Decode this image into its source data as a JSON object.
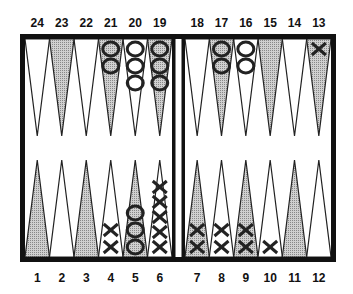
{
  "game": "backgammon",
  "colors": {
    "frame": "#111111",
    "dark_point": "#b8b8b8",
    "light_point": "#ffffff",
    "checker_stroke": "#222222"
  },
  "top_labels": [
    "24",
    "23",
    "22",
    "21",
    "20",
    "19",
    "18",
    "17",
    "16",
    "15",
    "14",
    "13"
  ],
  "bottom_labels": [
    "1",
    "2",
    "3",
    "4",
    "5",
    "6",
    "7",
    "8",
    "9",
    "10",
    "11",
    "12"
  ],
  "points": [
    {
      "n": 1,
      "shade": "dark",
      "checkers": []
    },
    {
      "n": 2,
      "shade": "light",
      "checkers": []
    },
    {
      "n": 3,
      "shade": "dark",
      "checkers": []
    },
    {
      "n": 4,
      "shade": "light",
      "checkers": [
        "X",
        "X"
      ]
    },
    {
      "n": 5,
      "shade": "dark",
      "checkers": [
        "O",
        "O",
        "O"
      ]
    },
    {
      "n": 6,
      "shade": "light",
      "checkers": [
        "X",
        "X",
        "X",
        "X",
        "X"
      ]
    },
    {
      "n": 7,
      "shade": "dark",
      "checkers": [
        "X",
        "X"
      ]
    },
    {
      "n": 8,
      "shade": "light",
      "checkers": [
        "X",
        "X"
      ]
    },
    {
      "n": 9,
      "shade": "dark",
      "checkers": [
        "X",
        "X"
      ]
    },
    {
      "n": 10,
      "shade": "light",
      "checkers": [
        "X"
      ]
    },
    {
      "n": 11,
      "shade": "dark",
      "checkers": []
    },
    {
      "n": 12,
      "shade": "light",
      "checkers": []
    },
    {
      "n": 13,
      "shade": "dark",
      "checkers": [
        "X"
      ]
    },
    {
      "n": 14,
      "shade": "light",
      "checkers": []
    },
    {
      "n": 15,
      "shade": "dark",
      "checkers": []
    },
    {
      "n": 16,
      "shade": "light",
      "checkers": [
        "O",
        "O"
      ]
    },
    {
      "n": 17,
      "shade": "dark",
      "checkers": [
        "O",
        "O"
      ]
    },
    {
      "n": 18,
      "shade": "light",
      "checkers": []
    },
    {
      "n": 19,
      "shade": "dark",
      "checkers": [
        "O",
        "O",
        "O"
      ]
    },
    {
      "n": 20,
      "shade": "light",
      "checkers": [
        "O",
        "O",
        "O"
      ]
    },
    {
      "n": 21,
      "shade": "dark",
      "checkers": [
        "O",
        "O"
      ]
    },
    {
      "n": 22,
      "shade": "light",
      "checkers": []
    },
    {
      "n": 23,
      "shade": "dark",
      "checkers": []
    },
    {
      "n": 24,
      "shade": "light",
      "checkers": []
    }
  ]
}
